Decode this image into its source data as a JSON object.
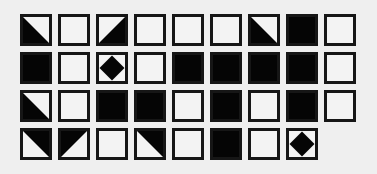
{
  "puzzle": {
    "rows": 4,
    "cols": 9,
    "colors": {
      "black": "#050505",
      "white": "#f3f3f3",
      "border": "#161616",
      "background": "#efefef"
    },
    "cells": [
      [
        "tri-bottom-left",
        "empty",
        "tri-bottom-right",
        "empty",
        "empty",
        "empty",
        "tri-bottom-left",
        "filled",
        "empty"
      ],
      [
        "filled",
        "empty",
        "diamond",
        "empty",
        "filled",
        "filled",
        "filled",
        "filled",
        "empty"
      ],
      [
        "tri-bottom-left",
        "empty",
        "filled",
        "filled",
        "empty",
        "filled",
        "empty",
        "filled",
        "empty"
      ],
      [
        "tri-top-right",
        "tri-top-left",
        "empty",
        "tri-top-right",
        "empty",
        "filled",
        "empty",
        "diamond",
        null
      ]
    ]
  }
}
